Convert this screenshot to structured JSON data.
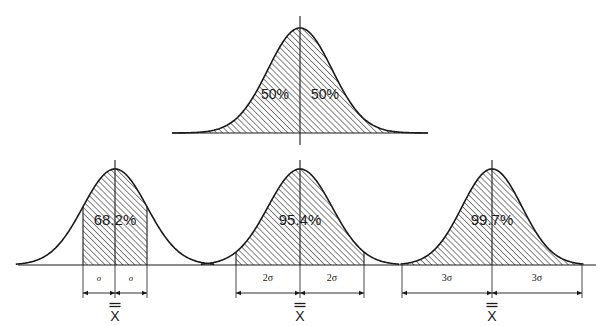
{
  "figure": {
    "background_color": "#ffffff",
    "ink_color": "#1a1a1a",
    "hatch_pattern": "diagonal-45-up"
  },
  "chart_data": {
    "type": "area",
    "xlabel": "",
    "ylabel": "",
    "grid": false,
    "legend": "none",
    "distribution": "normal",
    "mean_symbol": "X",
    "sigma_symbol": "σ",
    "curves": [
      {
        "id": "curve-half",
        "name": "Split at mean",
        "row": "top",
        "center_x": 300,
        "baseline_y": 133,
        "peak_y": 28,
        "sigma_px": 32,
        "shaded_from_sigma": -4,
        "shaded_to_sigma": 4,
        "area_labels": [
          {
            "text": "50%",
            "offset_sigma": -0.78
          },
          {
            "text": "50%",
            "offset_sigma": 0.78
          }
        ],
        "dimensions": [],
        "mean_label": null
      },
      {
        "id": "curve-1sigma",
        "name": "One sigma band",
        "row": "bottom",
        "center_x": 115,
        "baseline_y": 265,
        "peak_y": 169,
        "sigma_px": 32,
        "shaded_from_sigma": -1,
        "shaded_to_sigma": 1,
        "curve_from_sigma": -3.1,
        "curve_to_sigma": 3.1,
        "area_labels": [
          {
            "text": "68.2%",
            "offset_sigma": 0
          }
        ],
        "dimensions": [
          {
            "label": "σ",
            "from_sigma": -1,
            "to_sigma": 0
          },
          {
            "label": "σ",
            "from_sigma": 0,
            "to_sigma": 1
          }
        ],
        "mean_label": "X"
      },
      {
        "id": "curve-2sigma",
        "name": "Two sigma band",
        "row": "bottom",
        "center_x": 300,
        "baseline_y": 265,
        "peak_y": 169,
        "sigma_px": 32,
        "shaded_from_sigma": -2,
        "shaded_to_sigma": 2,
        "curve_from_sigma": -3.1,
        "curve_to_sigma": 3.1,
        "area_labels": [
          {
            "text": "95.4%",
            "offset_sigma": 0
          }
        ],
        "dimensions": [
          {
            "label": "2σ",
            "from_sigma": -2,
            "to_sigma": 0
          },
          {
            "label": "2σ",
            "from_sigma": 0,
            "to_sigma": 2
          }
        ],
        "mean_label": "X"
      },
      {
        "id": "curve-3sigma",
        "name": "Three sigma band",
        "row": "bottom",
        "center_x": 492,
        "baseline_y": 265,
        "peak_y": 169,
        "sigma_px": 30,
        "shaded_from_sigma": -3,
        "shaded_to_sigma": 3,
        "curve_from_sigma": -3.05,
        "curve_to_sigma": 3.05,
        "area_labels": [
          {
            "text": "99.7%",
            "offset_sigma": 0
          }
        ],
        "dimensions": [
          {
            "label": "3σ",
            "from_sigma": -3,
            "to_sigma": 0
          },
          {
            "label": "3σ",
            "from_sigma": 0,
            "to_sigma": 3
          }
        ],
        "mean_label": "X"
      }
    ],
    "baseline": {
      "from_x": 18,
      "to_x": 596,
      "y": 265
    },
    "annotations": [
      "50%",
      "50%",
      "68.2%",
      "95.4%",
      "99.7%",
      "σ",
      "σ",
      "2σ",
      "2σ",
      "3σ",
      "3σ",
      "X",
      "X",
      "X"
    ]
  }
}
